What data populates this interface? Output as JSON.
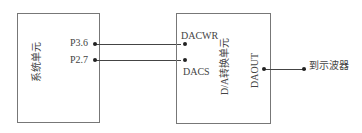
{
  "diagram": {
    "blocks": {
      "system_unit": {
        "label": "系统单元"
      },
      "da_unit": {
        "label": "D/A转换单元"
      }
    },
    "pins": {
      "p36": "P3.6",
      "p27": "P2.7",
      "dacwr": "DACWR",
      "dacs": "DACS",
      "daout": "DAOUT"
    },
    "output_target": "到示波器",
    "connections": [
      {
        "from": "P3.6",
        "to": "DACWR"
      },
      {
        "from": "P2.7",
        "to": "DACS"
      },
      {
        "from": "DAOUT",
        "to": "到示波器"
      }
    ]
  }
}
